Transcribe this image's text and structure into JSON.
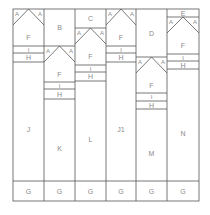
{
  "frame": {
    "x0": 13,
    "x1": 199,
    "y0": 9,
    "y1": 201,
    "g_top": 181
  },
  "colors": {
    "line": "#555555",
    "label": "#8a8a8a"
  },
  "columns": [
    {
      "x0": 13,
      "x1": 44,
      "top_box": null,
      "peak_y": 9,
      "diag_y": 25,
      "i_top": 46,
      "i_bot": 53,
      "h_bot": 62,
      "body_label": "J",
      "labels": {
        "a_left": "A",
        "a_right": "A",
        "f": "F",
        "i": "I",
        "h": "H",
        "g": "G"
      }
    },
    {
      "x0": 44,
      "x1": 75,
      "top_box": "B",
      "peak_y": 46,
      "diag_y": 62,
      "i_top": 82,
      "i_bot": 89,
      "h_bot": 99,
      "body_label": "K",
      "labels": {
        "a_left": "A",
        "a_right": "A",
        "f": "F",
        "i": "I",
        "h": "H",
        "g": "G"
      }
    },
    {
      "x0": 75,
      "x1": 106,
      "top_box": "C",
      "peak_y": 28,
      "diag_y": 44,
      "i_top": 65,
      "i_bot": 72,
      "h_bot": 81,
      "body_label": "L",
      "labels": {
        "a_left": "A",
        "a_right": "A",
        "f": "F",
        "i": "I",
        "h": "H",
        "g": "G"
      }
    },
    {
      "x0": 106,
      "x1": 136,
      "top_box": null,
      "peak_y": 9,
      "diag_y": 25,
      "i_top": 46,
      "i_bot": 53,
      "h_bot": 62,
      "body_label": "J1",
      "labels": {
        "a_left": "A",
        "a_right": "A",
        "f": "F",
        "i": "I",
        "h": "H",
        "g": "G"
      }
    },
    {
      "x0": 136,
      "x1": 167,
      "top_box": "D",
      "peak_y": 57,
      "diag_y": 73,
      "i_top": 93,
      "i_bot": 101,
      "h_bot": 109,
      "body_label": "M",
      "labels": {
        "a_left": "A",
        "a_right": "A",
        "f": "F",
        "i": "I",
        "h": "H",
        "g": "G"
      }
    },
    {
      "x0": 167,
      "x1": 199,
      "top_box": "E",
      "peak_y": 17,
      "diag_y": 33,
      "i_top": 54,
      "i_bot": 61,
      "h_bot": 69,
      "body_label": "N",
      "labels": {
        "a_left": "A",
        "a_right": "A",
        "f": "F",
        "i": "I",
        "h": "H",
        "g": "G"
      }
    }
  ]
}
